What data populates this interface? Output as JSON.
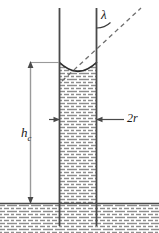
{
  "figure": {
    "name": "capillary-rise-diagram",
    "background_color": "#ffffff"
  },
  "labels": {
    "contact_angle": "λ",
    "diameter": "2r",
    "height_symbol": "h",
    "height_subscript": "c"
  },
  "colors": {
    "line": "#3a3a3a",
    "tube_wall": "#4a4a4a",
    "hatch": "#8d8d8d",
    "dash": "#6f6f6f",
    "text": "#1a1a1a"
  },
  "geometry": {
    "tube_left_x": 59,
    "tube_right_x": 97,
    "tube_top_y": 8,
    "tube_bottom_y": 226,
    "meniscus_bottom_y": 62,
    "reservoir_surface_y": 203,
    "column_top_y": 62,
    "dim_line_x": 30,
    "dim_top_y": 62,
    "dim_bottom_y": 203,
    "radius_arrow_y": 119,
    "tangent_x1": 62,
    "tangent_y1": 81,
    "tangent_x2": 141,
    "tangent_y2": 8
  },
  "elements": {
    "tube_wall_left": "left capillary tube wall",
    "tube_wall_right": "right capillary tube wall",
    "meniscus": "concave liquid meniscus",
    "liquid_column": "hatched liquid inside tube",
    "reservoir": "hatched liquid reservoir",
    "reservoir_line": "free surface line",
    "tangent_line": "dashed tangent at contact point",
    "angle_arc": "contact angle arc",
    "height_dimension": "capillary rise dimension line",
    "diameter_dimension": "tube inner diameter arrows"
  }
}
